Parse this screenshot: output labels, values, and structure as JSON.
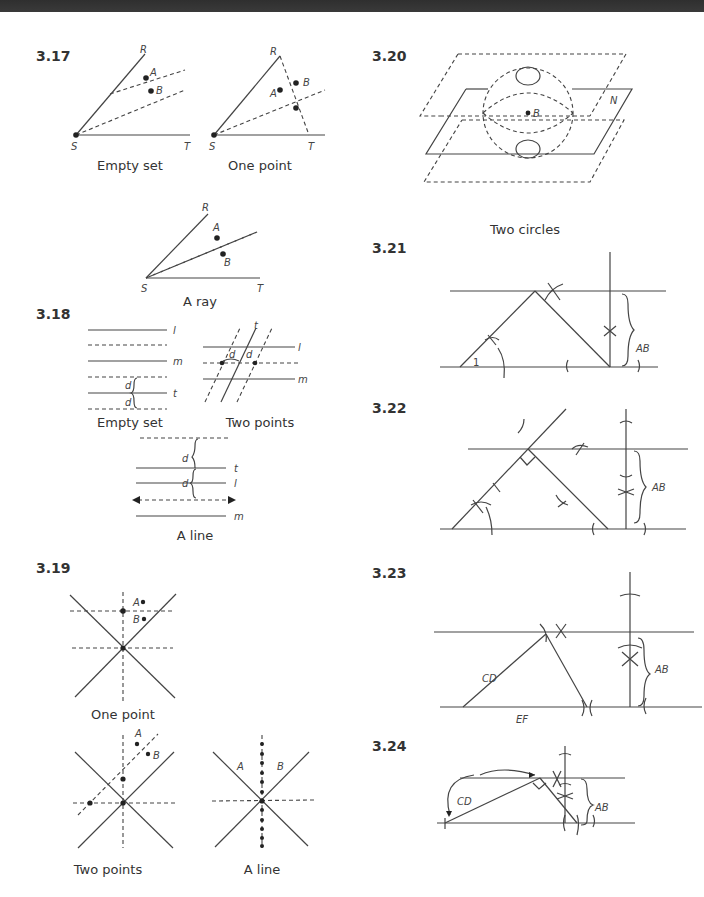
{
  "header": {
    "bar": "dark page header strip"
  },
  "problems": [
    {
      "id": "3.17",
      "captions": [
        "Empty set",
        "One point",
        "A ray"
      ],
      "point_labels": {
        "vertex": "S",
        "ray1": "R",
        "ray2": "T",
        "p1": "A",
        "p2": "B"
      }
    },
    {
      "id": "3.18",
      "captions": [
        "Empty set",
        "Two points",
        "A line"
      ],
      "line_labels": {
        "l": "l",
        "m": "m",
        "t": "t",
        "d": "d"
      }
    },
    {
      "id": "3.19",
      "captions": [
        "One point",
        "Two points",
        "A line"
      ],
      "point_labels": {
        "p1": "A",
        "p2": "B"
      }
    },
    {
      "id": "3.20",
      "captions": [
        "Two circles"
      ],
      "labels": {
        "plane": "N",
        "center": "B"
      }
    },
    {
      "id": "3.21",
      "labels": {
        "angle": "1",
        "length": "AB"
      }
    },
    {
      "id": "3.22",
      "labels": {
        "length": "AB"
      }
    },
    {
      "id": "3.23",
      "labels": {
        "side1": "CD",
        "side2": "EF",
        "length": "AB"
      }
    },
    {
      "id": "3.24",
      "labels": {
        "side1": "CD",
        "length": "AB"
      }
    }
  ]
}
